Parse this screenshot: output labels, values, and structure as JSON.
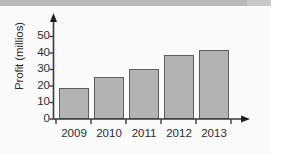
{
  "chart_data": {
    "type": "bar",
    "title": "",
    "subtitle": "",
    "xlabel": "",
    "ylabel": "Profit (millios)",
    "categories": [
      "2009",
      "2010",
      "2011",
      "2012",
      "2013"
    ],
    "values": [
      19,
      25.5,
      30.5,
      38.5,
      42
    ],
    "series": [
      {
        "name": "Profit",
        "values": [
          19,
          25.5,
          30.5,
          38.5,
          42
        ]
      }
    ],
    "ylim": [
      0,
      55
    ],
    "yticks": [
      "0",
      "10",
      "20",
      "30",
      "40",
      "50"
    ],
    "ytick_values": [
      0,
      10,
      20,
      30,
      40,
      50
    ],
    "grid": false,
    "legend": false,
    "legend_position": "none",
    "bar_color": "#b3b3b3",
    "bar_border_color": "#5e5e5e",
    "axis_color": "#3a3a3a",
    "text_color": "#2b2b2b",
    "background_color": "#fbfbfb",
    "annotations": []
  }
}
